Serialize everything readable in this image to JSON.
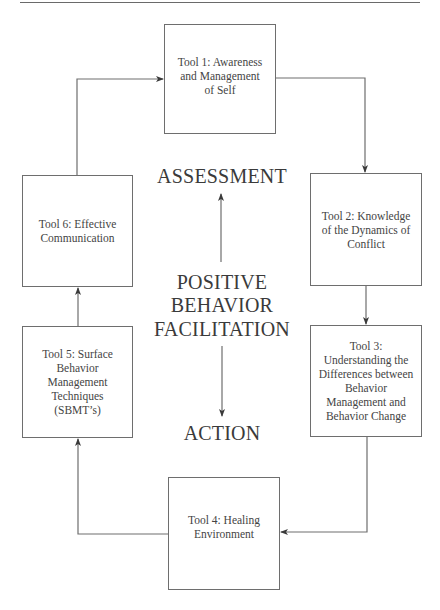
{
  "diagram": {
    "type": "cycle-flowchart",
    "center": {
      "top_label": "ASSESSMENT",
      "title_lines": [
        "POSITIVE",
        "BEHAVIOR",
        "FACILITATION"
      ],
      "bottom_label": "ACTION",
      "arrows": [
        {
          "from": "center-title",
          "to": "ASSESSMENT",
          "direction": "up"
        },
        {
          "from": "center-title",
          "to": "ACTION",
          "direction": "down"
        }
      ]
    },
    "tools": [
      {
        "id": "tool1",
        "label": "Tool 1: Awareness and Management of Self",
        "lines": [
          "Tool 1: Awareness",
          "and Management",
          "of Self"
        ]
      },
      {
        "id": "tool2",
        "label": "Tool 2: Knowledge of the Dynamics of Conflict",
        "lines": [
          "Tool 2: Knowledge",
          "of the Dynamics of",
          "Conflict"
        ]
      },
      {
        "id": "tool3",
        "label": "Tool 3: Understanding the Differences between Behavior Management and Behavior Change",
        "lines": [
          "Tool 3:",
          "Understanding the",
          "Differences between",
          "Behavior",
          "Management and",
          "Behavior Change"
        ]
      },
      {
        "id": "tool4",
        "label": "Tool 4: Healing Environment",
        "lines": [
          "Tool 4: Healing",
          "Environment"
        ]
      },
      {
        "id": "tool5",
        "label": "Tool 5: Surface Behavior Management Techniques (SBMT's)",
        "lines": [
          "Tool 5: Surface",
          "Behavior",
          "Management",
          "Techniques",
          "(SBMT’s)"
        ]
      },
      {
        "id": "tool6",
        "label": "Tool 6: Effective Communication",
        "lines": [
          "Tool 6: Effective",
          "Communication"
        ]
      }
    ],
    "edges": [
      {
        "from": "tool1",
        "to": "tool2"
      },
      {
        "from": "tool2",
        "to": "tool3"
      },
      {
        "from": "tool3",
        "to": "tool4"
      },
      {
        "from": "tool4",
        "to": "tool5"
      },
      {
        "from": "tool5",
        "to": "tool6"
      },
      {
        "from": "tool6",
        "to": "tool1"
      }
    ],
    "colors": {
      "line": "#6e6e6e",
      "text": "#3a3a3a",
      "background": "#ffffff"
    }
  }
}
